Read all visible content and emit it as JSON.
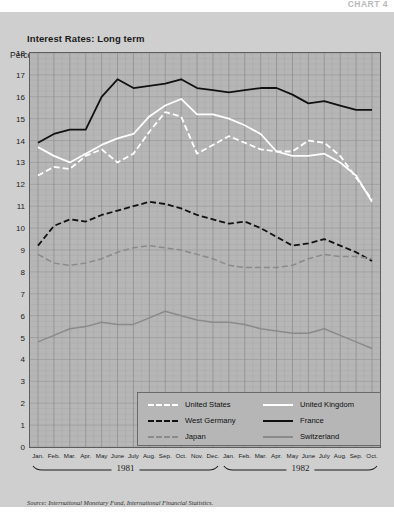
{
  "chart_number": "CHART 4",
  "title": "Interest Rates: Long term",
  "y_axis_label": "Percent",
  "source": "Source: International Monetary Fund, International Financial Statistics.",
  "years": [
    {
      "label": "1981",
      "start_index": 0,
      "end_index": 11
    },
    {
      "label": "1982",
      "start_index": 12,
      "end_index": 21
    }
  ],
  "legend": {
    "left_column": [
      {
        "label": "United States",
        "color": "#ffffff",
        "style": "dashed"
      },
      {
        "label": "West Germany",
        "color": "#111111",
        "style": "dashed"
      },
      {
        "label": "Japan",
        "color": "#8a8a8a",
        "style": "dashed"
      }
    ],
    "right_column": [
      {
        "label": "United Kingdom",
        "color": "#ffffff",
        "style": "solid"
      },
      {
        "label": "France",
        "color": "#111111",
        "style": "solid"
      },
      {
        "label": "Switzerland",
        "color": "#8a8a8a",
        "style": "solid"
      }
    ]
  },
  "chart_data": {
    "type": "line",
    "title": "Interest Rates: Long term",
    "xlabel": "",
    "ylabel": "Percent",
    "ylim": [
      0,
      18
    ],
    "ytick_step": 1,
    "yticks": [
      18,
      17,
      16,
      15,
      14,
      13,
      12,
      11,
      10,
      9,
      8,
      7,
      6,
      5,
      4,
      3,
      2,
      1,
      0
    ],
    "grid": true,
    "legend_position": "inside-bottom-center",
    "categories": [
      "Jan.",
      "Feb.",
      "Mar.",
      "Apr.",
      "May",
      "June",
      "July",
      "Aug.",
      "Sep.",
      "Oct.",
      "Nov.",
      "Dec.",
      "Jan.",
      "Feb.",
      "Mar.",
      "Apr.",
      "May",
      "June",
      "July",
      "Aug.",
      "Sep.",
      "Oct."
    ],
    "series": [
      {
        "name": "France",
        "color": "#111111",
        "style": "solid",
        "values": [
          13.9,
          14.3,
          14.5,
          14.5,
          16.0,
          16.8,
          16.4,
          16.5,
          16.6,
          16.8,
          16.4,
          16.3,
          16.2,
          16.3,
          16.4,
          16.4,
          16.1,
          15.7,
          15.8,
          15.6,
          15.4,
          15.4
        ]
      },
      {
        "name": "United Kingdom",
        "color": "#ffffff",
        "style": "solid",
        "values": [
          13.7,
          13.3,
          13.0,
          13.4,
          13.8,
          14.1,
          14.3,
          15.1,
          15.6,
          15.9,
          15.2,
          15.2,
          15.0,
          14.7,
          14.3,
          13.5,
          13.3,
          13.3,
          13.4,
          13.0,
          12.4,
          11.2
        ]
      },
      {
        "name": "United States",
        "color": "#ffffff",
        "style": "dashed",
        "values": [
          12.4,
          12.8,
          12.7,
          13.3,
          13.6,
          13.0,
          13.4,
          14.4,
          15.3,
          15.1,
          13.4,
          13.8,
          14.2,
          13.9,
          13.6,
          13.5,
          13.5,
          14.0,
          13.9,
          13.3,
          12.3,
          11.3
        ]
      },
      {
        "name": "West Germany",
        "color": "#111111",
        "style": "dashed",
        "values": [
          9.2,
          10.1,
          10.4,
          10.3,
          10.6,
          10.8,
          11.0,
          11.2,
          11.1,
          10.9,
          10.6,
          10.4,
          10.2,
          10.3,
          10.0,
          9.6,
          9.2,
          9.3,
          9.5,
          9.2,
          8.9,
          8.5
        ]
      },
      {
        "name": "Japan",
        "color": "#8a8a8a",
        "style": "dashed",
        "values": [
          8.8,
          8.4,
          8.3,
          8.4,
          8.6,
          8.9,
          9.1,
          9.2,
          9.1,
          9.0,
          8.8,
          8.6,
          8.3,
          8.2,
          8.2,
          8.2,
          8.3,
          8.6,
          8.8,
          8.7,
          8.7,
          8.6
        ]
      },
      {
        "name": "Switzerland",
        "color": "#8a8a8a",
        "style": "solid",
        "values": [
          4.8,
          5.1,
          5.4,
          5.5,
          5.7,
          5.6,
          5.6,
          5.9,
          6.2,
          6.0,
          5.8,
          5.7,
          5.7,
          5.6,
          5.4,
          5.3,
          5.2,
          5.2,
          5.4,
          5.1,
          4.8,
          4.5
        ]
      }
    ]
  }
}
